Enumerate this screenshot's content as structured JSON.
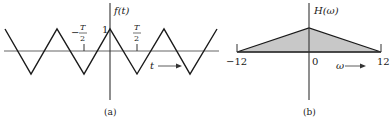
{
  "panel_a": {
    "caption": "(a)",
    "y_label": "f(t)",
    "x_label": "t",
    "peak_label": "1",
    "neg_half_label": {
      "sign": "−",
      "num": "T",
      "den": "2"
    },
    "pos_half_label": {
      "num": "T",
      "den": "2"
    },
    "waveform": "triangular wave"
  },
  "panel_b": {
    "caption": "(b)",
    "y_label": "H(ω)",
    "x_label": "ω",
    "tick_left": "−12",
    "tick_center": "0",
    "tick_right": "12",
    "shape": "triangle",
    "fill_color": "#c8c8c8"
  },
  "colors": {
    "line": "#1a1a1a",
    "axis": "#555555",
    "fill": "#c8c8c8"
  }
}
